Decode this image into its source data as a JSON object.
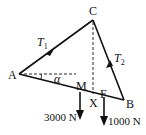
{
  "diagram": {
    "type": "free-body / truss triangle",
    "points": {
      "A": {
        "label": "A",
        "x": 19,
        "y": 74
      },
      "B": {
        "label": "B",
        "x": 124,
        "y": 100
      },
      "C": {
        "label": "C",
        "x": 93,
        "y": 20
      },
      "M": {
        "label": "M",
        "x": 80,
        "y": 92
      },
      "X": {
        "label": "X",
        "x": 93,
        "y": 95
      },
      "F": {
        "label": "F",
        "x": 104,
        "y": 95
      }
    },
    "tensions": {
      "t1": {
        "label": "T",
        "sub": "1"
      },
      "t2": {
        "label": "T",
        "sub": "2"
      }
    },
    "angle": {
      "label": "α"
    },
    "loads": [
      {
        "at": "M",
        "value": "3000 N"
      },
      {
        "at": "F",
        "value": "1000 N"
      }
    ],
    "colors": {
      "line": "#111111",
      "background": "#ffffff"
    }
  }
}
